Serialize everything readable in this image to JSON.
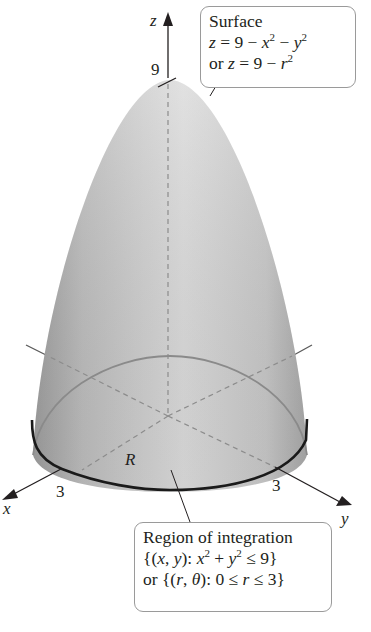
{
  "figure": {
    "type": "3d-paraboloid-over-disk",
    "axes": {
      "x_label": "x",
      "y_label": "y",
      "z_label": "z",
      "z_tick_label": "9",
      "x_tick_label": "3",
      "y_tick_label": "3"
    },
    "region_label": "R",
    "surface_callout": {
      "title": "Surface",
      "line1_lhs": "z",
      "line1_rhs_a": " = 9 − ",
      "line1_x": "x",
      "line1_mid": " − ",
      "line1_y": "y",
      "exp": "2",
      "line2_prefix": "or ",
      "line2_lhs": "z",
      "line2_rhs": " = 9 − ",
      "line2_r": "r"
    },
    "region_callout": {
      "title": "Region of integration",
      "line1_a": "{(",
      "line1_x": "x",
      "line1_comma": ", ",
      "line1_y": "y",
      "line1_b": "): ",
      "line1_x2": "x",
      "line1_plus": " + ",
      "line1_y2": "y",
      "line1_c": " ≤ 9}",
      "exp": "2",
      "line2_a": "or {(",
      "line2_r": "r",
      "line2_comma": ", ",
      "line2_theta": "θ",
      "line2_b": "): 0 ≤ ",
      "line2_r2": "r",
      "line2_c": " ≤ 3}"
    },
    "colors": {
      "surface_light": "#e6e6e6",
      "surface_dark": "#a9a9a9",
      "axis": "#231f20",
      "dashed": "#8c8c8c",
      "callout_border": "#9a9a9a"
    }
  }
}
